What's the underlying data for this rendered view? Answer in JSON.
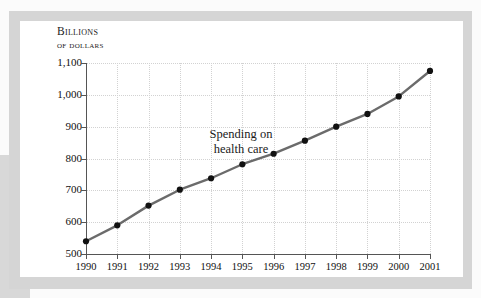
{
  "figure": {
    "axis_title_line1": "Billions",
    "axis_title_line2": "of dollars",
    "annotation_line1": "Spending on",
    "annotation_line2": "health care",
    "line_color": "#6b6b6b",
    "marker_color": "#111111",
    "grid_color": "#d2d2d2",
    "axis_color": "#555555",
    "card_background": "#ffffff",
    "frame_color": "#d5d5d5",
    "page_background": "#fbfbfb"
  },
  "chart_data": {
    "type": "line",
    "title": "",
    "subtitle": "",
    "xlabel": "",
    "ylabel": "Billions of dollars",
    "annotations": [
      "Spending on health care"
    ],
    "grid": true,
    "legend": "none",
    "xlim": [
      1990,
      2001
    ],
    "ylim": [
      500,
      1100
    ],
    "ytick_labels": [
      "1,100",
      "1,000",
      "900",
      "800",
      "700",
      "600",
      "500"
    ],
    "ytick_values": [
      1100,
      1000,
      900,
      800,
      700,
      600,
      500
    ],
    "categories": [
      1990,
      1991,
      1992,
      1993,
      1994,
      1995,
      1996,
      1997,
      1998,
      1999,
      2000,
      2001
    ],
    "xtick_labels": [
      "1990",
      "1991",
      "1992",
      "1993",
      "1994",
      "1995",
      "1996",
      "1997",
      "1998",
      "1999",
      "2000",
      "2001"
    ],
    "series": [
      {
        "name": "Spending on health care",
        "values": [
          540,
          590,
          652,
          702,
          738,
          782,
          815,
          856,
          900,
          940,
          995,
          1075
        ]
      }
    ]
  }
}
